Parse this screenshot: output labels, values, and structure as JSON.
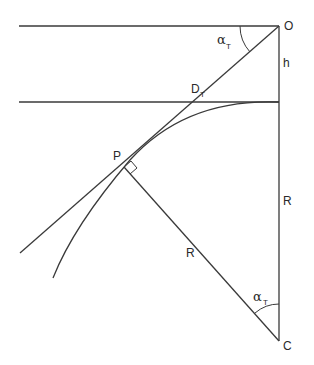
{
  "diagram": {
    "points": {
      "O": {
        "label": "O",
        "x": 279,
        "y": 26
      },
      "C": {
        "label": "C",
        "x": 279,
        "y": 341
      },
      "P": {
        "label": "P",
        "x": 124,
        "y": 167
      }
    },
    "labels": {
      "observer": "O",
      "center": "C",
      "tangent_point": "P",
      "height": "h",
      "radius_vertical": "R",
      "radius_slant": "R",
      "distance_main": "D",
      "distance_sub": "T",
      "angle_top_main": "α",
      "angle_top_sub": "T",
      "angle_bottom_main": "α",
      "angle_bottom_sub": "T"
    },
    "colors": {
      "line": "#3a3a3a",
      "text": "#2a2a2a",
      "background": "#ffffff"
    }
  }
}
